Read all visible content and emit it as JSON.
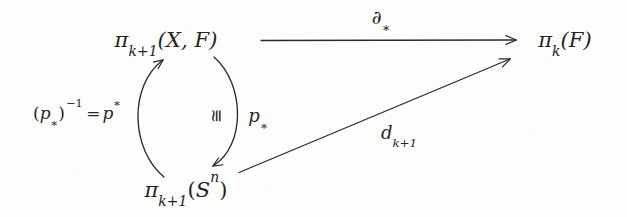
{
  "diagram": {
    "type": "commutative-diagram",
    "background_color": "#fdfdfc",
    "ink_color": "#262626",
    "nodes": [
      {
        "id": "pi-k1-X-F",
        "name": "top-left-node",
        "text": "π_{k+1}(X, F)",
        "parts": {
          "pi": "π",
          "sub": "k+1",
          "args": "(X, F)"
        },
        "x": 166,
        "y": 40
      },
      {
        "id": "pi-k-F",
        "name": "top-right-node",
        "text": "π_k(F)",
        "parts": {
          "pi": "π",
          "sub": "k",
          "args": "(F)"
        },
        "x": 565,
        "y": 40
      },
      {
        "id": "pi-k1-Sn",
        "name": "bottom-node",
        "text": "π_{k+1}(S^n)",
        "parts": {
          "pi": "π",
          "sub": "k+1",
          "args": "(S^n)"
        },
        "x": 186,
        "y": 190
      }
    ],
    "arrows": [
      {
        "id": "boundary-map",
        "name": "top-horizontal-arrow",
        "from": "pi-k1-X-F",
        "to": "pi-k-F",
        "shape": "straight",
        "label": "∂_*",
        "label_x": 381,
        "label_y": 17
      },
      {
        "id": "p-upper-star-inverse",
        "name": "left-curved-arrow-up",
        "from": "pi-k1-Sn",
        "to": "pi-k1-X-F",
        "shape": "curve-left",
        "label": "(p_*)^{-1} = p^*",
        "label_x": 77,
        "label_y": 113
      },
      {
        "id": "p-lower-star",
        "name": "right-curved-arrow-down",
        "from": "pi-k1-X-F",
        "to": "pi-k1-Sn",
        "shape": "curve-right",
        "label": "p_*",
        "label_x": 258,
        "label_y": 116,
        "annotation": "≅",
        "annotation_x": 216,
        "annotation_y": 116
      },
      {
        "id": "differential-d",
        "name": "diagonal-arrow",
        "from": "pi-k1-Sn",
        "to": "pi-k-F",
        "shape": "straight",
        "label": "d_{k+1}",
        "label_x": 399,
        "label_y": 133
      }
    ],
    "labels": {
      "partial_star": "∂",
      "partial_star_sub": "∗",
      "p_star_sub": "∗",
      "p_upper_star": "∗",
      "inverse_exponent": "−1",
      "equals": "=",
      "iso": "≅",
      "d_letter": "d",
      "d_sub": "k+1",
      "left_paren": "(",
      "right_paren": ")"
    }
  }
}
